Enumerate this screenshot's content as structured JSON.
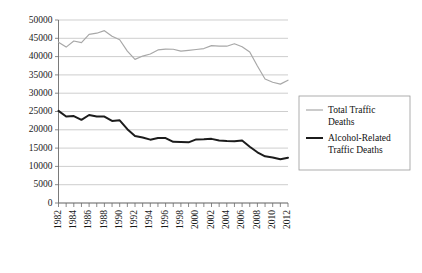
{
  "chart_data": {
    "type": "line",
    "title": "",
    "xlabel": "",
    "ylabel": "",
    "ylim": [
      0,
      50000
    ],
    "ytick_values": [
      0,
      5000,
      10000,
      15000,
      20000,
      25000,
      30000,
      35000,
      40000,
      45000,
      50000
    ],
    "ytick_labels": [
      "0",
      "5000",
      "10000",
      "15000",
      "20000",
      "25000",
      "30000",
      "35000",
      "40000",
      "45000",
      "50000"
    ],
    "grid": true,
    "grid_axis": "y",
    "legend_position": "right",
    "x": [
      1982,
      1983,
      1984,
      1985,
      1986,
      1987,
      1988,
      1989,
      1990,
      1991,
      1992,
      1993,
      1994,
      1995,
      1996,
      1997,
      1998,
      1999,
      2000,
      2001,
      2002,
      2003,
      2004,
      2005,
      2006,
      2007,
      2008,
      2009,
      2010,
      2011,
      2012
    ],
    "xtick_labels": [
      "1982",
      "1984",
      "1986",
      "1988",
      "1990",
      "1992",
      "1994",
      "1996",
      "1998",
      "2000",
      "2002",
      "2004",
      "2006",
      "2008",
      "2010",
      "2012"
    ],
    "xtick_label_step": 2,
    "xtick_label_rotation": 90,
    "series": [
      {
        "name": "Total Traffic Deaths",
        "color": "#a8a8a8",
        "width": 1.2,
        "values": [
          43945,
          42589,
          44257,
          43825,
          46087,
          46390,
          47087,
          45582,
          44599,
          41508,
          39250,
          40150,
          40716,
          41817,
          42065,
          42013,
          41501,
          41717,
          41945,
          42196,
          43005,
          42884,
          42836,
          43510,
          42708,
          41259,
          37423,
          33883,
          32999,
          32479,
          33561
        ]
      },
      {
        "name": "Alcohol-Related Traffic Deaths",
        "color": "#1c1c1c",
        "width": 2.0,
        "values": [
          25165,
          23646,
          23758,
          22716,
          24045,
          23641,
          23626,
          22424,
          22587,
          20159,
          18290,
          17908,
          17308,
          17732,
          17749,
          16711,
          16673,
          16572,
          17380,
          17400,
          17524,
          17105,
          16919,
          16885,
          17062,
          15387,
          13846,
          12744,
          12450,
          11952,
          12371
        ]
      }
    ]
  },
  "legend": {
    "entries": [
      {
        "label_line1": "Total Traffic",
        "label_line2": "Deaths"
      },
      {
        "label_line1": "Alcohol-Related",
        "label_line2": "Traffic Deaths"
      }
    ]
  }
}
